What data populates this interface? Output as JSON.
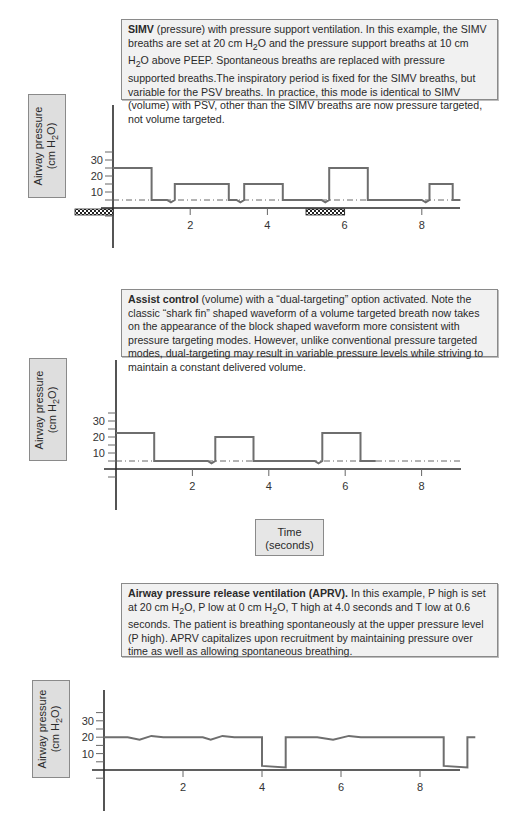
{
  "colors": {
    "trace": "#6e6e6e",
    "axis": "#2a2a2a",
    "baseline": "#555555",
    "caption_bg": "#f1f1f1",
    "label_bg": "#dedede"
  },
  "ylabel": {
    "line1": "Airway pressure",
    "line2_pre": "(cm H",
    "line2_sub": "2",
    "line2_post": "O)"
  },
  "time_label": {
    "line1": "Time",
    "line2": "(seconds)"
  },
  "chart_data": [
    {
      "type": "line",
      "title_bold": "SIMV",
      "caption_parts": [
        " (pressure) with pressure support ventilation. In this example, the SIMV breaths are set at 20 cm H",
        "2",
        "O and the pressure support breaths at 10 cm H",
        "2",
        "O above PEEP. Spontaneous breaths are replaced with pressure supported breaths.The inspiratory period is fixed for the SIMV breaths, but variable for the PSV breaths. In practice, this mode is identical to SIMV (volume) with PSV, other than the SIMV breaths are now pressure targeted, not volume targeted."
      ],
      "xlabel": "Time (seconds)",
      "ylabel": "Airway pressure (cm H2O)",
      "xlim": [
        0,
        9
      ],
      "ylim": [
        -10,
        35
      ],
      "x_ticks": [
        2,
        4,
        6,
        8
      ],
      "y_ticks": [
        10,
        20,
        30
      ],
      "peep": 5,
      "series": [
        {
          "name": "airway pressure",
          "points": [
            [
              0,
              25
            ],
            [
              1.0,
              25
            ],
            [
              1.0,
              5
            ],
            [
              1.4,
              5
            ],
            [
              1.5,
              3.5
            ],
            [
              1.6,
              5
            ],
            [
              1.6,
              15
            ],
            [
              3.0,
              15
            ],
            [
              3.0,
              5
            ],
            [
              3.2,
              5
            ],
            [
              3.3,
              3.5
            ],
            [
              3.4,
              5
            ],
            [
              3.4,
              15
            ],
            [
              4.4,
              15
            ],
            [
              4.4,
              5
            ],
            [
              5.4,
              5
            ],
            [
              5.5,
              3.5
            ],
            [
              5.6,
              5
            ],
            [
              5.6,
              25
            ],
            [
              6.6,
              25
            ],
            [
              6.6,
              5
            ],
            [
              8.0,
              5
            ],
            [
              8.1,
              3.5
            ],
            [
              8.2,
              5
            ],
            [
              8.2,
              15
            ],
            [
              8.8,
              15
            ],
            [
              8.8,
              5
            ],
            [
              9.0,
              5
            ]
          ]
        }
      ],
      "annotations": [
        {
          "type": "hatched-bar",
          "x_range": [
            -0.35,
            0
          ],
          "label": ""
        },
        {
          "type": "hatched-bar",
          "x_range": [
            5.0,
            6.0
          ],
          "label": ""
        }
      ]
    },
    {
      "type": "line",
      "title_bold": "Assist control",
      "caption_parts": [
        " (volume) with a “dual-targeting” option activated. Note the classic “shark fin” shaped waveform of a volume targeted breath now takes on the appearance of the block shaped waveform more consistent with pressure targeting modes. However, unlike conventional pressure targeted modes, dual-targeting may result in variable pressure levels while striving to maintain a constant delivered volume."
      ],
      "xlabel": "Time (seconds)",
      "ylabel": "Airway pressure (cm H2O)",
      "xlim": [
        0,
        9
      ],
      "ylim": [
        -10,
        35
      ],
      "x_ticks": [
        2,
        4,
        6,
        8
      ],
      "y_ticks": [
        10,
        20,
        30
      ],
      "peep": 5,
      "series": [
        {
          "name": "airway pressure",
          "points": [
            [
              0,
              22.5
            ],
            [
              1.0,
              22.5
            ],
            [
              1.0,
              5
            ],
            [
              2.4,
              5
            ],
            [
              2.5,
              3.5
            ],
            [
              2.6,
              5
            ],
            [
              2.6,
              20
            ],
            [
              3.6,
              20
            ],
            [
              3.6,
              5
            ],
            [
              5.2,
              5
            ],
            [
              5.3,
              3.5
            ],
            [
              5.4,
              5
            ],
            [
              5.4,
              22.5
            ],
            [
              6.4,
              22.5
            ],
            [
              6.4,
              5
            ],
            [
              6.8,
              5
            ]
          ]
        }
      ]
    },
    {
      "type": "line",
      "title_bold": "Airway pressure release ventilation (APRV).",
      "caption_parts": [
        " In this example, P high is set at 20 cm H",
        "2",
        "O, P low at 0 cm H",
        "2",
        "O, T high at 4.0 seconds and T low at 0.6 seconds. The patient is breathing spontaneously at the upper pressure level (P high). APRV capitalizes upon recruitment by maintaining pressure over time as well as allowing spontaneous breathing."
      ],
      "xlabel": "Time (seconds)",
      "ylabel": "Airway pressure (cm H2O)",
      "xlim": [
        0,
        9
      ],
      "ylim": [
        -10,
        35
      ],
      "x_ticks": [
        2,
        4,
        6,
        8
      ],
      "y_ticks": [
        10,
        20,
        30
      ],
      "series": [
        {
          "name": "airway pressure",
          "points": [
            [
              0,
              20
            ],
            [
              0.6,
              20
            ],
            [
              0.9,
              18.5
            ],
            [
              1.2,
              20.8
            ],
            [
              1.5,
              20
            ],
            [
              2.5,
              20
            ],
            [
              2.7,
              18.5
            ],
            [
              3.0,
              20.8
            ],
            [
              3.3,
              20
            ],
            [
              4.0,
              20
            ],
            [
              4.0,
              2.5
            ],
            [
              4.6,
              1.5
            ],
            [
              4.6,
              20
            ],
            [
              5.4,
              20
            ],
            [
              5.8,
              18.5
            ],
            [
              6.2,
              20.8
            ],
            [
              6.5,
              20
            ],
            [
              8.6,
              20
            ],
            [
              8.6,
              2.5
            ],
            [
              9.2,
              1.5
            ],
            [
              9.2,
              20
            ],
            [
              9.4,
              20
            ]
          ]
        }
      ]
    }
  ]
}
